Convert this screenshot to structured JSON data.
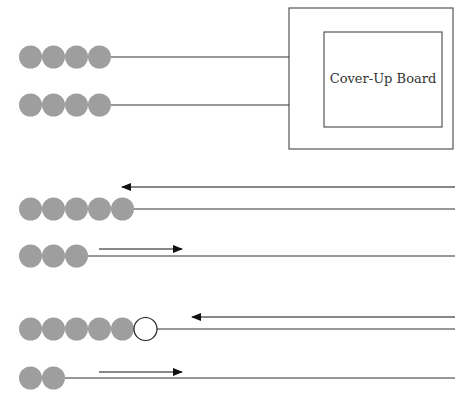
{
  "board": {
    "label": "Cover-Up Board",
    "outer": {
      "x": 289,
      "y": 8,
      "w": 164,
      "h": 141
    },
    "inner": {
      "x": 324,
      "y": 32,
      "w": 118,
      "h": 95
    }
  },
  "colors": {
    "bead": "#9e9e9e",
    "bead_empty": "#ffffff",
    "line": "#333333",
    "arrow": "#111111"
  },
  "bead_diameter": 23,
  "bead_start_x": 19,
  "rows": [
    {
      "name": "row-1",
      "y": 57,
      "gray_beads": 4,
      "empty_beads": 0,
      "line_to": 289,
      "arrow": null
    },
    {
      "name": "row-2",
      "y": 105,
      "gray_beads": 4,
      "empty_beads": 0,
      "line_to": 289,
      "arrow": null
    },
    {
      "name": "row-3",
      "y": 209,
      "gray_beads": 5,
      "empty_beads": 0,
      "line_to": 455,
      "arrow": {
        "y": 187,
        "from": 455,
        "to": 122,
        "direction": "left"
      }
    },
    {
      "name": "row-4",
      "y": 256,
      "gray_beads": 3,
      "empty_beads": 0,
      "line_to": 455,
      "arrow": {
        "y": 249,
        "from": 99,
        "to": 182,
        "direction": "right"
      }
    },
    {
      "name": "row-5",
      "y": 329,
      "gray_beads": 5,
      "empty_beads": 1,
      "line_to": 455,
      "arrow": {
        "y": 317,
        "from": 455,
        "to": 192,
        "direction": "left"
      }
    },
    {
      "name": "row-6",
      "y": 378,
      "gray_beads": 2,
      "empty_beads": 0,
      "line_to": 455,
      "arrow": {
        "y": 372,
        "from": 99,
        "to": 182,
        "direction": "right"
      }
    }
  ]
}
